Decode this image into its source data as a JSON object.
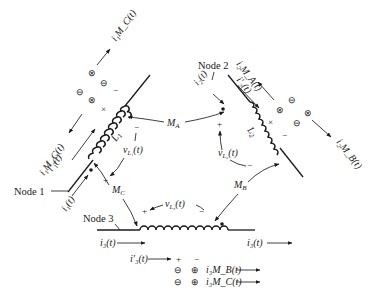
{
  "diagram": {
    "type": "coupled-inductor-network",
    "nodes": {
      "node1": "Node 1",
      "node2": "Node 2",
      "node3": "Node 3"
    },
    "inductors": {
      "l1": "L",
      "l1_sub": "1",
      "l2": "L",
      "l2_sub": "2"
    },
    "mutuals": {
      "ma": "M",
      "ma_sub": "A",
      "mb": "M",
      "mb_sub": "B",
      "mc": "M",
      "mc_sub": "C"
    },
    "voltages": {
      "vl1": "v",
      "vl1_sub": "L₁",
      "vl2": "v",
      "vl2_sub": "L₂",
      "vl3": "v",
      "vl3_sub": "L₃",
      "arg": "(t)"
    },
    "currents": {
      "i1": "i₁(t)",
      "i1_prime": "i′₁(t)",
      "i1mc": "i₁M_C(t)",
      "i1mc_top": "i₁M_C(t)",
      "i2": "i₂(t)",
      "i2_prime": "i′₂(t)",
      "i2ma": "i₂M_A(t)",
      "i2mb": "i₂M_B(t)",
      "i3_left": "i₃(t)",
      "i3_right": "i₃(t)",
      "i3_prime": "i′₃(t)",
      "i3mb": "i₃M_B(t)",
      "i3mc": "i₃M_C(t)"
    },
    "polarity": {
      "plus": "+",
      "minus": "−",
      "cross": "×",
      "circle_plus": "⊕",
      "circle_minus": "⊖",
      "circle_times": "⊗"
    },
    "colors": {
      "ink": "#1a1a1a",
      "background": "#ffffff"
    }
  }
}
